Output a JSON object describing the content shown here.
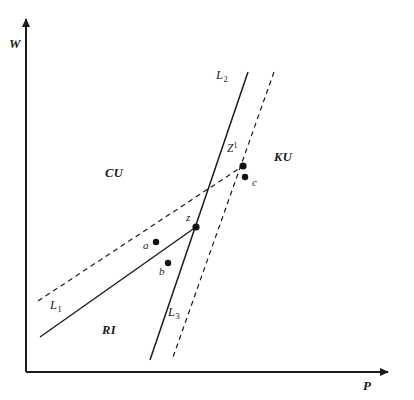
{
  "figure": {
    "type": "line-diagram",
    "background_color": "#ffffff",
    "ink_color": "#1a1a1a"
  },
  "axes": {
    "y_axis": {
      "label": "W",
      "origin": [
        26,
        372
      ],
      "tip": [
        26,
        15
      ]
    },
    "x_axis": {
      "label": "P",
      "origin": [
        26,
        372
      ],
      "tip": [
        394,
        372
      ]
    }
  },
  "lines": [
    {
      "id": "L1-solid",
      "label": "L",
      "subscript": "1",
      "style": "solid",
      "from": [
        40,
        337
      ],
      "to": [
        196,
        227
      ]
    },
    {
      "id": "L1-dashed",
      "label": "L",
      "subscript": "1",
      "style": "dashed",
      "from": [
        38,
        301
      ],
      "to": [
        246,
        164
      ]
    },
    {
      "id": "L2-solid",
      "label": "L",
      "subscript": "2",
      "style": "solid",
      "from": [
        248,
        72
      ],
      "to": [
        150,
        360
      ]
    },
    {
      "id": "L3-dashed",
      "label": "L",
      "subscript": "3",
      "style": "dashed",
      "from": [
        274,
        72
      ],
      "to": [
        172,
        360
      ]
    }
  ],
  "line_labels": [
    {
      "name": "L1",
      "text": "L",
      "sub": "1",
      "x": 50,
      "y": 299
    },
    {
      "name": "L2",
      "text": "L",
      "sub": "2",
      "x": 216,
      "y": 69
    },
    {
      "name": "L3",
      "text": "L",
      "sub": "3",
      "x": 168,
      "y": 306
    }
  ],
  "regions": [
    {
      "name": "CU",
      "label": "CU",
      "x": 105,
      "y": 167
    },
    {
      "name": "KU",
      "label": "KU",
      "x": 274,
      "y": 151
    },
    {
      "name": "RI",
      "label": "RI",
      "x": 102,
      "y": 324
    }
  ],
  "points": [
    {
      "name": "a",
      "label": "a",
      "px": 156,
      "py": 242,
      "lx": 143,
      "ly": 240,
      "radius": 3.2
    },
    {
      "name": "b",
      "label": "b",
      "px": 168,
      "py": 263,
      "lx": 159,
      "ly": 266,
      "radius": 3.2
    },
    {
      "name": "c",
      "label": "c",
      "px": 245,
      "py": 177,
      "lx": 252,
      "ly": 177,
      "radius": 3.2
    },
    {
      "name": "z",
      "label": "z",
      "px": 196,
      "py": 227,
      "lx": 186,
      "ly": 212,
      "radius": 3.6
    },
    {
      "name": "Z1",
      "label": "Z",
      "sup": "1",
      "px": 243,
      "py": 166,
      "lx": 227,
      "ly": 143,
      "radius": 3.6
    }
  ]
}
